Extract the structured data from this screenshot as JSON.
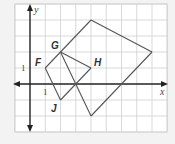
{
  "diagram": {
    "type": "coordinate-plane",
    "axes": {
      "x_label": "x",
      "y_label": "y",
      "x_tick_label": "1",
      "y_tick_label": "1"
    },
    "grid": {
      "x_range": [
        -1,
        9
      ],
      "y_range": [
        -3,
        5
      ]
    },
    "points": [
      {
        "name": "F",
        "x": 1,
        "y": 1
      },
      {
        "name": "G",
        "x": 2,
        "y": 2
      },
      {
        "name": "H",
        "x": 4,
        "y": 1
      },
      {
        "name": "J",
        "x": 2,
        "y": -1
      }
    ],
    "segments": [
      {
        "from": [
          1,
          1
        ],
        "to": [
          4,
          4
        ]
      },
      {
        "from": [
          4,
          4
        ],
        "to": [
          8,
          2
        ]
      },
      {
        "from": [
          8,
          2
        ],
        "to": [
          4,
          -2
        ]
      },
      {
        "from": [
          4,
          -2
        ],
        "to": [
          2,
          2
        ]
      },
      {
        "from": [
          2,
          2
        ],
        "to": [
          4,
          1
        ]
      },
      {
        "from": [
          4,
          1
        ],
        "to": [
          2,
          -1
        ]
      },
      {
        "from": [
          2,
          -1
        ],
        "to": [
          1,
          1
        ]
      }
    ],
    "colors": {
      "line": "#555555",
      "grid": "#cfcfcf",
      "axis": "#222222",
      "background": "#ffffff",
      "page": "#f3f3f3"
    }
  }
}
